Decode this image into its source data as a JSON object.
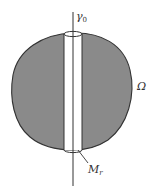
{
  "diagram": {
    "labels": {
      "axis": "γ",
      "axis_sub": "0",
      "region": "Ω",
      "tube": "M",
      "tube_sub": "r"
    },
    "colors": {
      "region_fill": "#8a8a8a",
      "stroke": "#333333",
      "tube_fill": "#ffffff",
      "background": "#ffffff"
    }
  }
}
